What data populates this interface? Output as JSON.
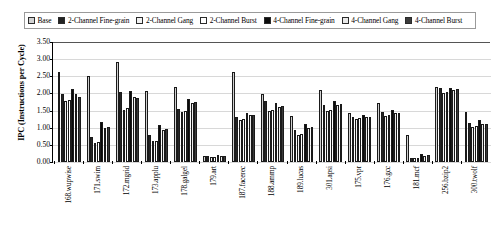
{
  "chart_data": {
    "type": "bar",
    "title": "",
    "xlabel": "",
    "ylabel": "IPC (Instructions per Cycle)",
    "ylim": [
      0.0,
      3.5
    ],
    "ytick_step": 0.5,
    "ytick_labels": [
      "3.50",
      "3.00",
      "2.50",
      "2.00",
      "1.50",
      "1.00",
      "0.50",
      "0.00"
    ],
    "grid": true,
    "legend_position": "top",
    "categories": [
      "168.wupwise",
      "171.swim",
      "172.mgrid",
      "173.applu",
      "178.galgel",
      "179.art",
      "187.facerec",
      "188.ammp",
      "189.lucas",
      "301.apsi",
      "175.vpr",
      "176.gcc",
      "181.mcf",
      "256.bzip2",
      "300.twolf"
    ],
    "series": [
      {
        "name": "Base",
        "color": "#d0d0d0",
        "values": [
          2.62,
          2.5,
          2.93,
          2.06,
          2.2,
          0.17,
          2.62,
          1.98,
          1.33,
          2.1,
          1.42,
          1.73,
          0.8,
          2.18,
          1.45
        ]
      },
      {
        "name": "2-Channel Fine-grain",
        "color": "#242424",
        "values": [
          1.97,
          0.72,
          2.05,
          0.78,
          1.56,
          0.17,
          1.3,
          1.77,
          0.92,
          1.66,
          1.32,
          1.45,
          0.13,
          2.15,
          1.14
        ]
      },
      {
        "name": "2-Channel Gang",
        "color": "#f4f4f4",
        "values": [
          1.78,
          0.55,
          1.52,
          0.6,
          1.45,
          0.15,
          1.24,
          1.49,
          0.8,
          1.5,
          1.26,
          1.33,
          0.11,
          2.02,
          1.02
        ]
      },
      {
        "name": "2-Channel Burst",
        "color": "#ffffff",
        "values": [
          1.8,
          0.58,
          1.58,
          0.62,
          1.48,
          0.15,
          1.26,
          1.52,
          0.83,
          1.53,
          1.28,
          1.36,
          0.12,
          2.05,
          1.05
        ]
      },
      {
        "name": "4-Channel Fine-grain",
        "color": "#0a0a0a",
        "values": [
          2.13,
          1.16,
          2.08,
          1.07,
          1.85,
          0.2,
          1.43,
          1.71,
          1.12,
          1.79,
          1.36,
          1.52,
          0.24,
          2.16,
          1.22
        ]
      },
      {
        "name": "4-Channel Gang",
        "color": "#ececec",
        "values": [
          1.97,
          1.0,
          1.9,
          0.93,
          1.72,
          0.19,
          1.36,
          1.6,
          1.0,
          1.66,
          1.3,
          1.42,
          0.19,
          2.1,
          1.1
        ]
      },
      {
        "name": "4-Channel Burst",
        "color": "#3a3a3a",
        "values": [
          1.9,
          1.02,
          1.88,
          0.96,
          1.74,
          0.19,
          1.38,
          1.62,
          1.03,
          1.68,
          1.31,
          1.44,
          0.2,
          2.12,
          1.12
        ]
      }
    ]
  }
}
